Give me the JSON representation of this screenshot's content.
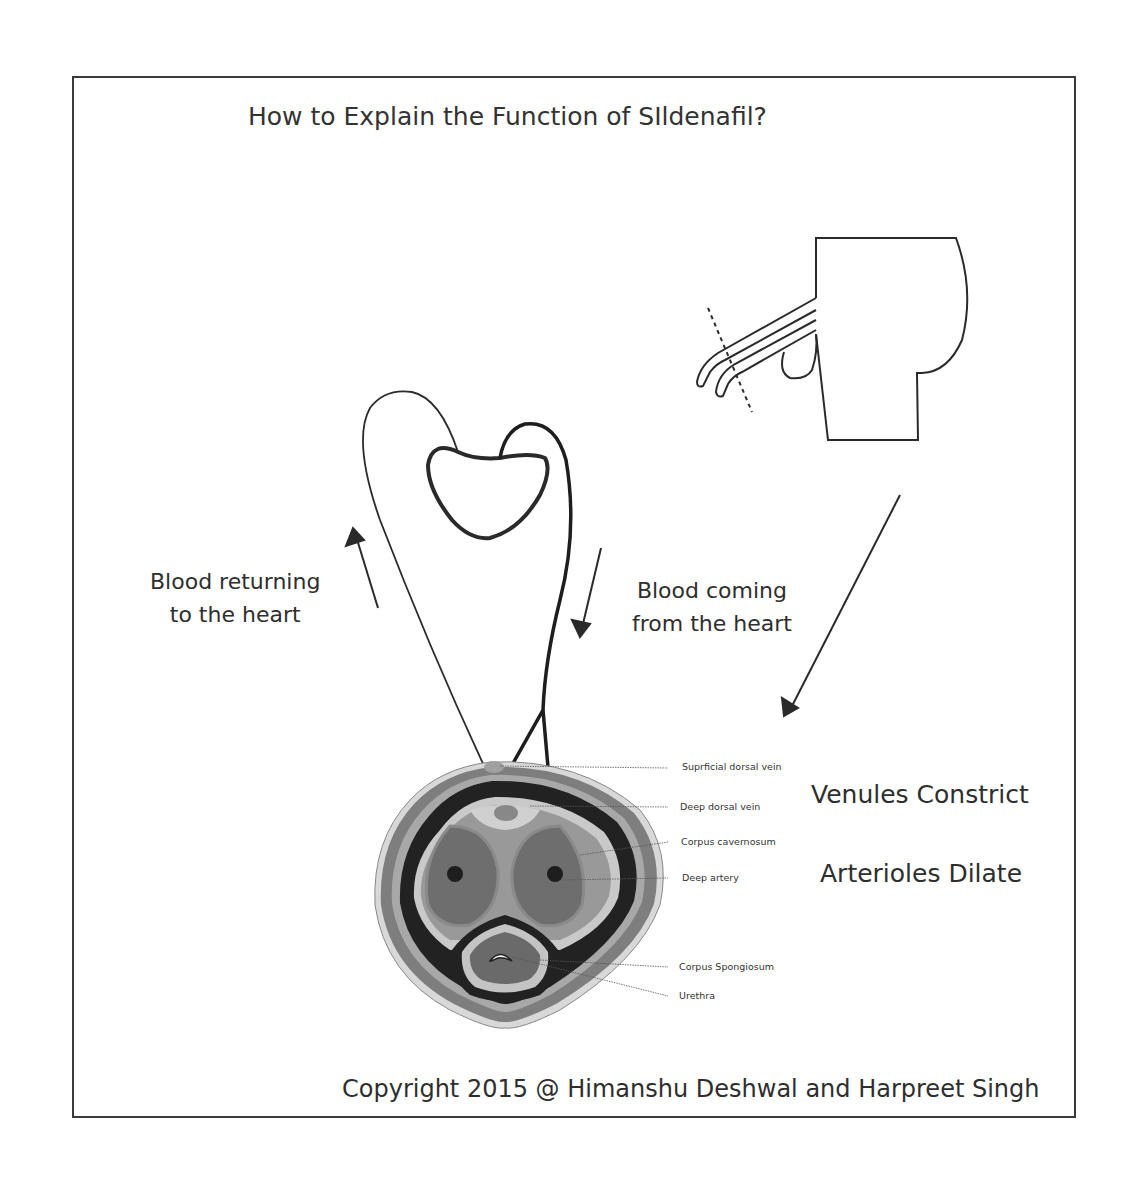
{
  "diagram": {
    "title": "How to Explain the Function of SIldenafil?",
    "flow_labels": {
      "returning": [
        "Blood returning",
        "to the heart"
      ],
      "coming": [
        "Blood coming",
        "from the heart"
      ]
    },
    "effects": {
      "venules": "Venules Constrict",
      "arterioles": "Arterioles Dilate"
    },
    "anatomy_labels": [
      "Suprficial dorsal vein",
      "Deep dorsal vein",
      "Corpus cavernosum",
      "Deep artery",
      "Corpus Spongiosum",
      "Urethra"
    ],
    "copyright": "Copyright 2015 @ Himanshu Deshwal and Harpreet Singh",
    "colors": {
      "line": "#2a2a2a",
      "outer_tissue": "#7a7a7a",
      "dark_band": "#1e1e1e",
      "light_band": "#c8c8c8",
      "cavernosum": "#6e6e6e",
      "cavernosum_outer": "#8c8c8c",
      "septum": "#9a9a9a"
    }
  }
}
